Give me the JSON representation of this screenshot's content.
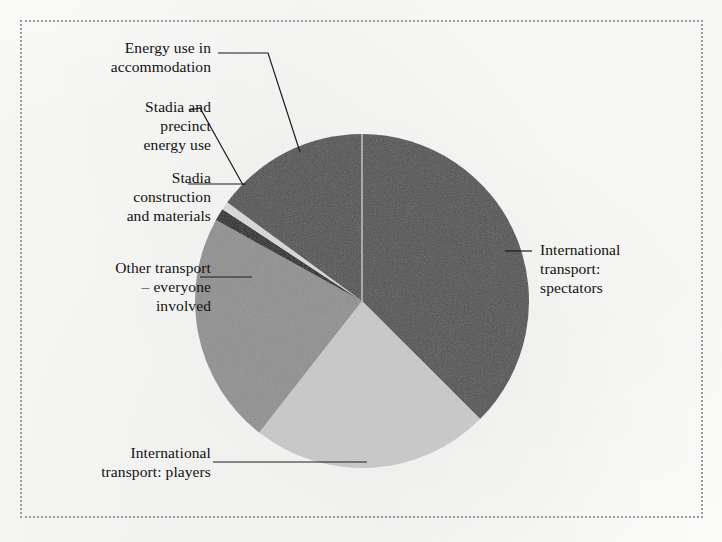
{
  "figure": {
    "background_color": "#fbfbfa",
    "border_style": "dotted",
    "border_color": "#9a9a9a"
  },
  "chart_data": {
    "type": "pie",
    "title": "",
    "subtitle": "",
    "xlabel": "",
    "ylabel": "",
    "legend_position": "none",
    "grid": false,
    "labels_position": "outside-with-leader-lines",
    "start_angle_deg": 0,
    "direction": "clockwise",
    "center": {
      "x": 362,
      "y": 301
    },
    "radius": 167,
    "categories": [
      "International transport: spectators",
      "International transport: players",
      "Other transport – everyone involved",
      "Stadia construction and materials",
      "Stadia and precinct energy use",
      "Energy use in accommodation"
    ],
    "values": [
      37.5,
      23.0,
      22.5,
      1.2,
      0.8,
      15.0
    ],
    "slices": [
      {
        "label": "International transport: spectators",
        "value": 37.5,
        "start_deg": 0,
        "end_deg": 135,
        "color": "#4f4f4f"
      },
      {
        "label": "International transport: players",
        "value": 23.0,
        "start_deg": 135,
        "end_deg": 218,
        "color": "#c9c9c9"
      },
      {
        "label": "Other transport – everyone involved",
        "value": 22.5,
        "start_deg": 218,
        "end_deg": 299,
        "color": "#8f8f8f"
      },
      {
        "label": "Stadia construction and materials",
        "value": 1.2,
        "start_deg": 299,
        "end_deg": 303.3,
        "color": "#1a1a1a"
      },
      {
        "label": "Stadia and precinct energy use",
        "value": 0.8,
        "start_deg": 303.3,
        "end_deg": 306.2,
        "color": "#d9d9d9"
      },
      {
        "label": "Energy use in accommodation",
        "value": 15.0,
        "start_deg": 306.2,
        "end_deg": 360,
        "color": "#4f4f4f"
      }
    ]
  },
  "labels": {
    "accommodation": "Energy use in\naccommodation",
    "stadia_energy": "Stadia and\nprecinct\nenergy use",
    "stadia_construction": "Stadia\nconstruction\nand materials",
    "other_transport": "Other transport\n– everyone\ninvolved",
    "intl_players": "International\ntransport: players",
    "intl_spectators": "International\ntransport:\nspectators"
  }
}
